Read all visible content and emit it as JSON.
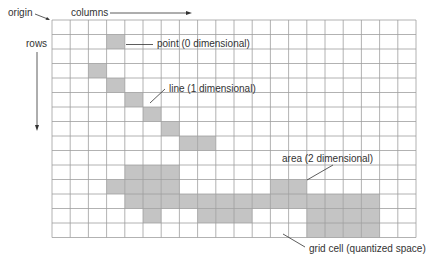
{
  "diagram": {
    "type": "raster-grid",
    "grid": {
      "origin_x": 52,
      "origin_y": 20,
      "columns": 20,
      "rows": 15,
      "cell_width": 18.2,
      "cell_height": 14.5,
      "line_color": "#9e9e9e",
      "cell_fill": "#ffffff",
      "shaded_fill": "#c4c4c4"
    },
    "features": {
      "point": {
        "label": "point (0 dimensional)",
        "cells": [
          [
            3,
            1
          ]
        ]
      },
      "line": {
        "label": "line (1 dimensional)",
        "cells": [
          [
            2,
            3
          ],
          [
            3,
            4
          ],
          [
            4,
            5
          ],
          [
            5,
            6
          ],
          [
            6,
            7
          ],
          [
            7,
            8
          ],
          [
            8,
            8
          ]
        ]
      },
      "area": {
        "label": "area (2 dimensional)",
        "cells": [
          [
            4,
            10
          ],
          [
            5,
            10
          ],
          [
            6,
            10
          ],
          [
            3,
            11
          ],
          [
            4,
            11
          ],
          [
            5,
            11
          ],
          [
            6,
            11
          ],
          [
            12,
            11
          ],
          [
            13,
            11
          ],
          [
            4,
            12
          ],
          [
            5,
            12
          ],
          [
            6,
            12
          ],
          [
            7,
            12
          ],
          [
            8,
            12
          ],
          [
            9,
            12
          ],
          [
            10,
            12
          ],
          [
            11,
            12
          ],
          [
            12,
            12
          ],
          [
            13,
            12
          ],
          [
            14,
            12
          ],
          [
            15,
            12
          ],
          [
            16,
            12
          ],
          [
            17,
            12
          ],
          [
            5,
            13
          ],
          [
            8,
            13
          ],
          [
            9,
            13
          ],
          [
            10,
            13
          ],
          [
            14,
            13
          ],
          [
            15,
            13
          ],
          [
            16,
            13
          ],
          [
            17,
            13
          ],
          [
            14,
            14
          ],
          [
            15,
            14
          ],
          [
            16,
            14
          ],
          [
            17,
            14
          ]
        ]
      },
      "grid_cell": {
        "label": "grid cell (quantized space)"
      }
    },
    "axes": {
      "origin_label": "origin",
      "columns_label": "columns",
      "rows_label": "rows"
    },
    "text_color": "#333333"
  }
}
